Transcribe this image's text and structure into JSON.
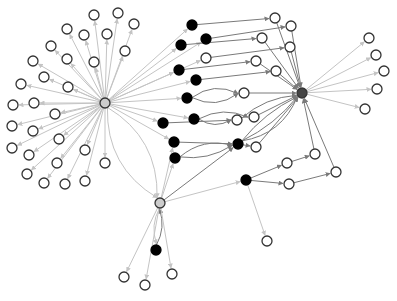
{
  "diagram": {
    "type": "directed-network-graph",
    "width": 397,
    "height": 301,
    "colors": {
      "background": "#ffffff",
      "node_stroke": "#333333",
      "white_node_fill": "#ffffff",
      "black_node_fill": "#000000",
      "gray_hub_fill": "#cccccc",
      "dark_hub_fill": "#444444",
      "light_edge": "#c4c4c4",
      "dark_edge": "#7a7a7a"
    },
    "nodes": [
      {
        "id": "H1",
        "x": 105,
        "y": 103,
        "r": 5,
        "kind": "gray-hub"
      },
      {
        "id": "H2",
        "x": 302,
        "y": 93,
        "r": 5,
        "kind": "dark-hub"
      },
      {
        "id": "H3",
        "x": 160,
        "y": 203,
        "r": 5,
        "kind": "gray-hub"
      },
      {
        "id": "L1",
        "x": 94,
        "y": 15,
        "r": 5,
        "kind": "white"
      },
      {
        "id": "L2",
        "x": 118,
        "y": 13,
        "r": 5,
        "kind": "white"
      },
      {
        "id": "L3",
        "x": 134,
        "y": 24,
        "r": 5,
        "kind": "white"
      },
      {
        "id": "L4",
        "x": 67,
        "y": 29,
        "r": 5,
        "kind": "white"
      },
      {
        "id": "L5",
        "x": 84,
        "y": 35,
        "r": 5,
        "kind": "white"
      },
      {
        "id": "L6",
        "x": 107,
        "y": 34,
        "r": 5,
        "kind": "white"
      },
      {
        "id": "L7",
        "x": 51,
        "y": 46,
        "r": 5,
        "kind": "white"
      },
      {
        "id": "L8",
        "x": 67,
        "y": 59,
        "r": 5,
        "kind": "white"
      },
      {
        "id": "L9",
        "x": 125,
        "y": 51,
        "r": 5,
        "kind": "white"
      },
      {
        "id": "L10",
        "x": 33,
        "y": 61,
        "r": 5,
        "kind": "white"
      },
      {
        "id": "L11",
        "x": 94,
        "y": 62,
        "r": 5,
        "kind": "white"
      },
      {
        "id": "L12",
        "x": 44,
        "y": 77,
        "r": 5,
        "kind": "white"
      },
      {
        "id": "L13",
        "x": 21,
        "y": 84,
        "r": 5,
        "kind": "white"
      },
      {
        "id": "L14",
        "x": 68,
        "y": 87,
        "r": 5,
        "kind": "white"
      },
      {
        "id": "L15",
        "x": 13,
        "y": 105,
        "r": 5,
        "kind": "white"
      },
      {
        "id": "L16",
        "x": 34,
        "y": 103,
        "r": 5,
        "kind": "white"
      },
      {
        "id": "L17",
        "x": 55,
        "y": 114,
        "r": 5,
        "kind": "white"
      },
      {
        "id": "L18",
        "x": 12,
        "y": 126,
        "r": 5,
        "kind": "white"
      },
      {
        "id": "L19",
        "x": 33,
        "y": 131,
        "r": 5,
        "kind": "white"
      },
      {
        "id": "L20",
        "x": 59,
        "y": 139,
        "r": 5,
        "kind": "white"
      },
      {
        "id": "L21",
        "x": 12,
        "y": 148,
        "r": 5,
        "kind": "white"
      },
      {
        "id": "L22",
        "x": 29,
        "y": 155,
        "r": 5,
        "kind": "white"
      },
      {
        "id": "L23",
        "x": 85,
        "y": 150,
        "r": 5,
        "kind": "white"
      },
      {
        "id": "L24",
        "x": 57,
        "y": 163,
        "r": 5,
        "kind": "white"
      },
      {
        "id": "L25",
        "x": 105,
        "y": 163,
        "r": 5,
        "kind": "white"
      },
      {
        "id": "L26",
        "x": 27,
        "y": 174,
        "r": 5,
        "kind": "white"
      },
      {
        "id": "L27",
        "x": 44,
        "y": 183,
        "r": 5,
        "kind": "white"
      },
      {
        "id": "L28",
        "x": 65,
        "y": 184,
        "r": 5,
        "kind": "white"
      },
      {
        "id": "L29",
        "x": 85,
        "y": 181,
        "r": 5,
        "kind": "white"
      },
      {
        "id": "B1",
        "x": 192,
        "y": 25,
        "r": 5,
        "kind": "black"
      },
      {
        "id": "B2",
        "x": 181,
        "y": 45,
        "r": 5,
        "kind": "black"
      },
      {
        "id": "B3",
        "x": 206,
        "y": 39,
        "r": 5,
        "kind": "black"
      },
      {
        "id": "B4",
        "x": 179,
        "y": 70,
        "r": 5,
        "kind": "black"
      },
      {
        "id": "B5",
        "x": 196,
        "y": 80,
        "r": 5,
        "kind": "black"
      },
      {
        "id": "B6",
        "x": 187,
        "y": 98,
        "r": 5,
        "kind": "black"
      },
      {
        "id": "B7",
        "x": 163,
        "y": 123,
        "r": 5,
        "kind": "black"
      },
      {
        "id": "B8",
        "x": 194,
        "y": 119,
        "r": 5,
        "kind": "black"
      },
      {
        "id": "B9",
        "x": 174,
        "y": 142,
        "r": 5,
        "kind": "black"
      },
      {
        "id": "B10",
        "x": 175,
        "y": 158,
        "r": 5,
        "kind": "black"
      },
      {
        "id": "B11",
        "x": 238,
        "y": 144,
        "r": 5,
        "kind": "black"
      },
      {
        "id": "B12",
        "x": 246,
        "y": 180,
        "r": 5,
        "kind": "black"
      },
      {
        "id": "B13",
        "x": 156,
        "y": 250,
        "r": 5,
        "kind": "black"
      },
      {
        "id": "M1",
        "x": 275,
        "y": 18,
        "r": 5,
        "kind": "white"
      },
      {
        "id": "M2",
        "x": 291,
        "y": 26,
        "r": 5,
        "kind": "white"
      },
      {
        "id": "M3",
        "x": 262,
        "y": 38,
        "r": 5,
        "kind": "white"
      },
      {
        "id": "M4",
        "x": 290,
        "y": 47,
        "r": 5,
        "kind": "white"
      },
      {
        "id": "M5",
        "x": 206,
        "y": 58,
        "r": 5,
        "kind": "white"
      },
      {
        "id": "M6",
        "x": 256,
        "y": 61,
        "r": 5,
        "kind": "white"
      },
      {
        "id": "M7",
        "x": 276,
        "y": 71,
        "r": 5,
        "kind": "white"
      },
      {
        "id": "M8",
        "x": 244,
        "y": 93,
        "r": 5,
        "kind": "white"
      },
      {
        "id": "M9",
        "x": 237,
        "y": 120,
        "r": 5,
        "kind": "white"
      },
      {
        "id": "M10",
        "x": 254,
        "y": 117,
        "r": 5,
        "kind": "white"
      },
      {
        "id": "M11",
        "x": 256,
        "y": 147,
        "r": 5,
        "kind": "white"
      },
      {
        "id": "M12",
        "x": 287,
        "y": 163,
        "r": 5,
        "kind": "white"
      },
      {
        "id": "M13",
        "x": 315,
        "y": 154,
        "r": 5,
        "kind": "white"
      },
      {
        "id": "M14",
        "x": 289,
        "y": 184,
        "r": 5,
        "kind": "white"
      },
      {
        "id": "M15",
        "x": 336,
        "y": 172,
        "r": 5,
        "kind": "white"
      },
      {
        "id": "R1",
        "x": 369,
        "y": 38,
        "r": 5,
        "kind": "white"
      },
      {
        "id": "R2",
        "x": 376,
        "y": 55,
        "r": 5,
        "kind": "white"
      },
      {
        "id": "R3",
        "x": 384,
        "y": 71,
        "r": 5,
        "kind": "white"
      },
      {
        "id": "R4",
        "x": 377,
        "y": 89,
        "r": 5,
        "kind": "white"
      },
      {
        "id": "R5",
        "x": 365,
        "y": 109,
        "r": 5,
        "kind": "white"
      },
      {
        "id": "S1",
        "x": 124,
        "y": 277,
        "r": 5,
        "kind": "white"
      },
      {
        "id": "S2",
        "x": 145,
        "y": 285,
        "r": 5,
        "kind": "white"
      },
      {
        "id": "S3",
        "x": 172,
        "y": 274,
        "r": 5,
        "kind": "white"
      },
      {
        "id": "S4",
        "x": 267,
        "y": 241,
        "r": 5,
        "kind": "white"
      }
    ],
    "edges": [
      {
        "from": "H1",
        "to": "L1",
        "style": "light"
      },
      {
        "from": "H1",
        "to": "L2",
        "style": "light"
      },
      {
        "from": "H1",
        "to": "L3",
        "style": "light"
      },
      {
        "from": "H1",
        "to": "L4",
        "style": "light"
      },
      {
        "from": "H1",
        "to": "L5",
        "style": "light"
      },
      {
        "from": "H1",
        "to": "L6",
        "style": "light"
      },
      {
        "from": "H1",
        "to": "L7",
        "style": "light"
      },
      {
        "from": "H1",
        "to": "L8",
        "style": "light"
      },
      {
        "from": "H1",
        "to": "L9",
        "style": "light"
      },
      {
        "from": "H1",
        "to": "L10",
        "style": "light"
      },
      {
        "from": "H1",
        "to": "L11",
        "style": "light"
      },
      {
        "from": "H1",
        "to": "L12",
        "style": "light"
      },
      {
        "from": "H1",
        "to": "L13",
        "style": "light"
      },
      {
        "from": "H1",
        "to": "L14",
        "style": "light"
      },
      {
        "from": "H1",
        "to": "L15",
        "style": "light"
      },
      {
        "from": "H1",
        "to": "L16",
        "style": "light"
      },
      {
        "from": "H1",
        "to": "L17",
        "style": "light"
      },
      {
        "from": "H1",
        "to": "L18",
        "style": "light"
      },
      {
        "from": "H1",
        "to": "L19",
        "style": "light"
      },
      {
        "from": "H1",
        "to": "L20",
        "style": "light"
      },
      {
        "from": "H1",
        "to": "L21",
        "style": "light"
      },
      {
        "from": "H1",
        "to": "L22",
        "style": "light"
      },
      {
        "from": "H1",
        "to": "L23",
        "style": "light"
      },
      {
        "from": "H1",
        "to": "L24",
        "style": "light"
      },
      {
        "from": "H1",
        "to": "L25",
        "style": "light"
      },
      {
        "from": "H1",
        "to": "L26",
        "style": "light"
      },
      {
        "from": "H1",
        "to": "L27",
        "style": "light"
      },
      {
        "from": "H1",
        "to": "L28",
        "style": "light"
      },
      {
        "from": "H1",
        "to": "L29",
        "style": "light"
      },
      {
        "from": "H1",
        "to": "B1",
        "style": "light"
      },
      {
        "from": "H1",
        "to": "B2",
        "style": "light"
      },
      {
        "from": "H1",
        "to": "B3",
        "style": "light"
      },
      {
        "from": "H1",
        "to": "B4",
        "style": "light"
      },
      {
        "from": "H1",
        "to": "B5",
        "style": "light"
      },
      {
        "from": "H1",
        "to": "B6",
        "style": "light"
      },
      {
        "from": "H1",
        "to": "B7",
        "style": "light"
      },
      {
        "from": "H1",
        "to": "B8",
        "style": "light"
      },
      {
        "from": "H1",
        "to": "B9",
        "style": "light"
      },
      {
        "from": "H1",
        "to": "M5",
        "style": "light"
      },
      {
        "from": "H1",
        "to": "H3",
        "style": "light",
        "curve": 30
      },
      {
        "from": "H1",
        "to": "H3",
        "style": "light",
        "curve": -30
      },
      {
        "from": "B1",
        "to": "M1",
        "style": "dark"
      },
      {
        "from": "B2",
        "to": "M3",
        "style": "dark"
      },
      {
        "from": "B3",
        "to": "M2",
        "style": "dark"
      },
      {
        "from": "M5",
        "to": "M4",
        "style": "dark"
      },
      {
        "from": "B4",
        "to": "M6",
        "style": "dark"
      },
      {
        "from": "B5",
        "to": "M7",
        "style": "dark"
      },
      {
        "from": "B6",
        "to": "M8",
        "style": "dark",
        "curve": 14
      },
      {
        "from": "B6",
        "to": "M8",
        "style": "dark",
        "curve": -14
      },
      {
        "from": "B7",
        "to": "M9",
        "style": "dark"
      },
      {
        "from": "B8",
        "to": "M9",
        "style": "dark",
        "curve": 10
      },
      {
        "from": "B8",
        "to": "M10",
        "style": "dark",
        "curve": -12
      },
      {
        "from": "B9",
        "to": "B11",
        "style": "dark"
      },
      {
        "from": "B10",
        "to": "B11",
        "style": "dark",
        "curve": 10
      },
      {
        "from": "B10",
        "to": "B11",
        "style": "dark",
        "curve": -14
      },
      {
        "from": "B11",
        "to": "M11",
        "style": "dark"
      },
      {
        "from": "H3",
        "to": "B11",
        "style": "dark"
      },
      {
        "from": "H3",
        "to": "B12",
        "style": "light"
      },
      {
        "from": "B12",
        "to": "M12",
        "style": "dark"
      },
      {
        "from": "B12",
        "to": "M14",
        "style": "dark"
      },
      {
        "from": "M12",
        "to": "M13",
        "style": "dark"
      },
      {
        "from": "M14",
        "to": "M15",
        "style": "dark"
      },
      {
        "from": "B12",
        "to": "S4",
        "style": "light"
      },
      {
        "from": "M1",
        "to": "H2",
        "style": "dark"
      },
      {
        "from": "M2",
        "to": "H2",
        "style": "dark"
      },
      {
        "from": "M3",
        "to": "H2",
        "style": "dark"
      },
      {
        "from": "M4",
        "to": "H2",
        "style": "dark"
      },
      {
        "from": "M6",
        "to": "H2",
        "style": "dark"
      },
      {
        "from": "M7",
        "to": "H2",
        "style": "dark"
      },
      {
        "from": "M8",
        "to": "H2",
        "style": "dark"
      },
      {
        "from": "M10",
        "to": "H2",
        "style": "dark"
      },
      {
        "from": "M9",
        "to": "H2",
        "style": "dark",
        "curve": -10
      },
      {
        "from": "B11",
        "to": "H2",
        "style": "dark",
        "curve": 8
      },
      {
        "from": "B11",
        "to": "H2",
        "style": "dark",
        "curve": -8
      },
      {
        "from": "B11",
        "to": "H2",
        "style": "dark",
        "curve": 20
      },
      {
        "from": "M11",
        "to": "H2",
        "style": "dark"
      },
      {
        "from": "M13",
        "to": "H2",
        "style": "dark"
      },
      {
        "from": "M15",
        "to": "H2",
        "style": "dark"
      },
      {
        "from": "H2",
        "to": "R1",
        "style": "light"
      },
      {
        "from": "H2",
        "to": "R2",
        "style": "light"
      },
      {
        "from": "H2",
        "to": "R3",
        "style": "light"
      },
      {
        "from": "H2",
        "to": "R4",
        "style": "light"
      },
      {
        "from": "H2",
        "to": "R5",
        "style": "light"
      },
      {
        "from": "H3",
        "to": "B9",
        "style": "light"
      },
      {
        "from": "H3",
        "to": "B10",
        "style": "light"
      },
      {
        "from": "H3",
        "to": "B13",
        "style": "light",
        "curve": 8
      },
      {
        "from": "B13",
        "to": "H3",
        "style": "dark",
        "curve": 8
      },
      {
        "from": "H3",
        "to": "S1",
        "style": "light"
      },
      {
        "from": "H3",
        "to": "S2",
        "style": "light"
      },
      {
        "from": "H3",
        "to": "S3",
        "style": "light"
      }
    ]
  }
}
